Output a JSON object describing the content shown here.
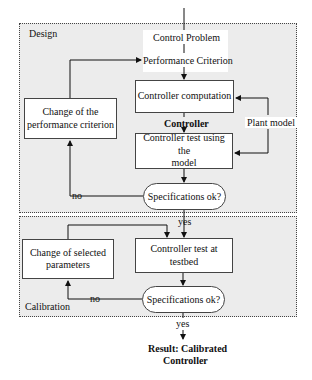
{
  "design": {
    "region_label": "Design",
    "control_problem": "Control Problem",
    "performance_criterion": "Performance Criterion",
    "controller_computation": "Controller computation",
    "controller_output": "Controller",
    "plant_model": "Plant model",
    "change_performance_line1": "Change of the",
    "change_performance_line2": "performance criterion",
    "controller_test_model_line1": "Controller test using the",
    "controller_test_model_line2": "model",
    "specs_check": "Specifications ok?",
    "no_label": "no",
    "yes_label": "yes"
  },
  "calibration": {
    "region_label": "Calibration",
    "change_params_line1": "Change of selected",
    "change_params_line2": "parameters",
    "controller_test_testbed": "Controller test at testbed",
    "specs_check": "Specifications ok?",
    "no_label": "no",
    "yes_label": "yes"
  },
  "result": {
    "line1": "Result: Calibrated",
    "line2": "Controller"
  }
}
